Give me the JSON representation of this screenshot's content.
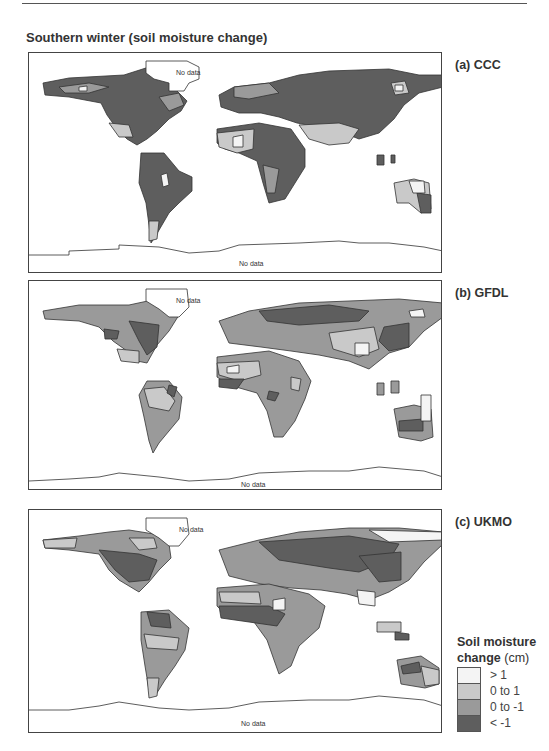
{
  "figure": {
    "title": "Southern winter (soil moisture change)",
    "panels": [
      {
        "id": "a",
        "label": "(a)  CCC",
        "no_data_north": "No data",
        "no_data_south": "No data"
      },
      {
        "id": "b",
        "label": "(b)  GFDL",
        "no_data_north": "No data",
        "no_data_south": "No data"
      },
      {
        "id": "c",
        "label": "(c)  UKMO",
        "no_data_north": "No data",
        "no_data_south": "No data"
      }
    ],
    "legend": {
      "title_line1": "Soil moisture",
      "title_line2": "change",
      "unit": "(cm)",
      "entries": [
        {
          "label": "> 1",
          "color": "#f4f4f4"
        },
        {
          "label": "0 to 1",
          "color": "#c9c9c9"
        },
        {
          "label": "0 to -1",
          "color": "#9a9a9a"
        },
        {
          "label": "< -1",
          "color": "#5e5e5e"
        }
      ]
    }
  }
}
